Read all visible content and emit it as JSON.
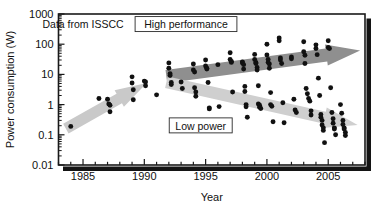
{
  "chart_data": {
    "type": "scatter",
    "title": "",
    "xlabel": "Year",
    "ylabel": "Power consumption (W)",
    "xlim": [
      1983,
      2008
    ],
    "ylim": [
      0.01,
      1000
    ],
    "yscale": "log",
    "grid": false,
    "legend_position": "none",
    "xticks": [
      1985,
      1990,
      1995,
      2000,
      2005
    ],
    "xticklabels": [
      "1985",
      "1990",
      "1995",
      "2000",
      "2005"
    ],
    "xminortick_step": 1,
    "yticks": [
      0.01,
      0.1,
      1,
      10,
      100,
      1000
    ],
    "yticklabels": [
      "0.01",
      "0.1",
      "1",
      "10",
      "100",
      "1000"
    ],
    "annotations": [
      {
        "name": "source-note",
        "text": "Data from ISSCC",
        "x": 1985.0,
        "y": 430,
        "boxed": false
      },
      {
        "name": "high-performance-label",
        "text": "High performance",
        "x": 1993.4,
        "y": 430,
        "boxed": true
      },
      {
        "name": "low-power-label",
        "text": "Low power",
        "x": 1994.6,
        "y": 0.19,
        "boxed": true
      }
    ],
    "arrows": [
      {
        "name": "early-trend-arrow",
        "color": "#c9c9c9",
        "from": {
          "x": 1983.6,
          "y": 0.16
        },
        "to": {
          "x": 1990.2,
          "y": 5.2
        }
      },
      {
        "name": "high-performance-arrow",
        "color": "#8f8f8f",
        "from": {
          "x": 1991.8,
          "y": 8.5
        },
        "to": {
          "x": 2007.6,
          "y": 62
        }
      },
      {
        "name": "low-power-arrow",
        "color": "#cfcfcf",
        "from": {
          "x": 1991.8,
          "y": 5.5
        },
        "to": {
          "x": 2007.4,
          "y": 0.21
        }
      }
    ],
    "series": [
      {
        "name": "ISSCC processors",
        "marker": "filled-circle",
        "color": "#111111",
        "points": [
          [
            1984.0,
            0.19
          ],
          [
            1986.3,
            1.6
          ],
          [
            1987.0,
            1.5
          ],
          [
            1987.1,
            1.05
          ],
          [
            1987.2,
            0.95
          ],
          [
            1987.2,
            0.58
          ],
          [
            1989.0,
            8.3
          ],
          [
            1989.0,
            5.2
          ],
          [
            1989.1,
            3.1
          ],
          [
            1989.1,
            1.45
          ],
          [
            1990.0,
            6.0
          ],
          [
            1990.1,
            5.6
          ],
          [
            1990.1,
            4.2
          ],
          [
            1991.0,
            2.1
          ],
          [
            1992.0,
            24
          ],
          [
            1992.0,
            16
          ],
          [
            1992.1,
            10.5
          ],
          [
            1992.1,
            9.2
          ],
          [
            1992.2,
            5.4
          ],
          [
            1992.2,
            4.6
          ],
          [
            1993.0,
            5.6
          ],
          [
            1993.1,
            3.4
          ],
          [
            1994.0,
            22
          ],
          [
            1994.0,
            14
          ],
          [
            1994.1,
            12
          ],
          [
            1994.1,
            3.6
          ],
          [
            1994.2,
            2.6
          ],
          [
            1994.2,
            1.9
          ],
          [
            1995.0,
            30
          ],
          [
            1995.0,
            19
          ],
          [
            1995.1,
            16
          ],
          [
            1995.1,
            15
          ],
          [
            1995.2,
            5.4
          ],
          [
            1995.3,
            0.78
          ],
          [
            1995.3,
            0.72
          ],
          [
            1996.0,
            21
          ],
          [
            1996.1,
            0.86
          ],
          [
            1997.0,
            52
          ],
          [
            1997.0,
            31
          ],
          [
            1997.1,
            27
          ],
          [
            1997.1,
            25
          ],
          [
            1997.2,
            2.6
          ],
          [
            1998.0,
            26
          ],
          [
            1998.0,
            24
          ],
          [
            1998.1,
            21
          ],
          [
            1998.1,
            15
          ],
          [
            1998.2,
            4.0
          ],
          [
            1998.2,
            2.7
          ],
          [
            1998.3,
            1.0
          ],
          [
            1998.3,
            0.85
          ],
          [
            1998.4,
            0.38
          ],
          [
            1999.0,
            46
          ],
          [
            1999.0,
            31
          ],
          [
            1999.1,
            25
          ],
          [
            1999.1,
            23
          ],
          [
            1999.2,
            17
          ],
          [
            1999.2,
            14
          ],
          [
            1999.3,
            4.2
          ],
          [
            1999.3,
            1.05
          ],
          [
            1999.4,
            0.95
          ],
          [
            1999.4,
            0.82
          ],
          [
            1999.5,
            0.74
          ],
          [
            2000.0,
            100
          ],
          [
            2000.0,
            44
          ],
          [
            2000.1,
            31
          ],
          [
            2000.1,
            25
          ],
          [
            2000.2,
            22
          ],
          [
            2000.2,
            16
          ],
          [
            2000.3,
            2.5
          ],
          [
            2000.3,
            1.0
          ],
          [
            2000.4,
            0.88
          ],
          [
            2000.5,
            0.27
          ],
          [
            2001.0,
            160
          ],
          [
            2001.0,
            130
          ],
          [
            2001.1,
            35
          ],
          [
            2001.1,
            30
          ],
          [
            2001.2,
            23
          ],
          [
            2001.3,
            1.15
          ],
          [
            2001.4,
            0.25
          ],
          [
            2002.0,
            38
          ],
          [
            2002.0,
            33
          ],
          [
            2002.2,
            1.5
          ],
          [
            2002.3,
            0.66
          ],
          [
            2002.4,
            0.55
          ],
          [
            2003.0,
            120
          ],
          [
            2003.0,
            56
          ],
          [
            2003.1,
            43
          ],
          [
            2003.1,
            23
          ],
          [
            2003.2,
            3.4
          ],
          [
            2003.3,
            2.3
          ],
          [
            2003.4,
            1.6
          ],
          [
            2003.5,
            1.3
          ],
          [
            2003.6,
            0.62
          ],
          [
            2003.6,
            0.45
          ],
          [
            2004.0,
            95
          ],
          [
            2004.0,
            72
          ],
          [
            2004.1,
            45
          ],
          [
            2004.2,
            7.5
          ],
          [
            2004.3,
            2.0
          ],
          [
            2004.4,
            0.47
          ],
          [
            2004.4,
            0.38
          ],
          [
            2004.5,
            0.3
          ],
          [
            2004.5,
            0.21
          ],
          [
            2004.6,
            0.17
          ],
          [
            2004.6,
            0.14
          ],
          [
            2004.7,
            0.055
          ],
          [
            2005.0,
            130
          ],
          [
            2005.0,
            78
          ],
          [
            2005.1,
            72
          ],
          [
            2005.2,
            3.6
          ],
          [
            2005.3,
            0.55
          ],
          [
            2005.4,
            0.34
          ],
          [
            2005.4,
            0.24
          ],
          [
            2005.5,
            0.17
          ],
          [
            2005.5,
            0.155
          ],
          [
            2005.6,
            0.1
          ],
          [
            2006.0,
            1.0
          ],
          [
            2006.1,
            0.52
          ],
          [
            2006.2,
            0.3
          ],
          [
            2006.2,
            0.22
          ],
          [
            2006.3,
            0.17
          ],
          [
            2006.3,
            0.155
          ],
          [
            2006.4,
            0.12
          ],
          [
            2006.4,
            0.095
          ]
        ]
      }
    ]
  },
  "figure": {
    "frame_color": "#1a1a1a",
    "shadow_color": "#111111",
    "background": "#ffffff"
  }
}
